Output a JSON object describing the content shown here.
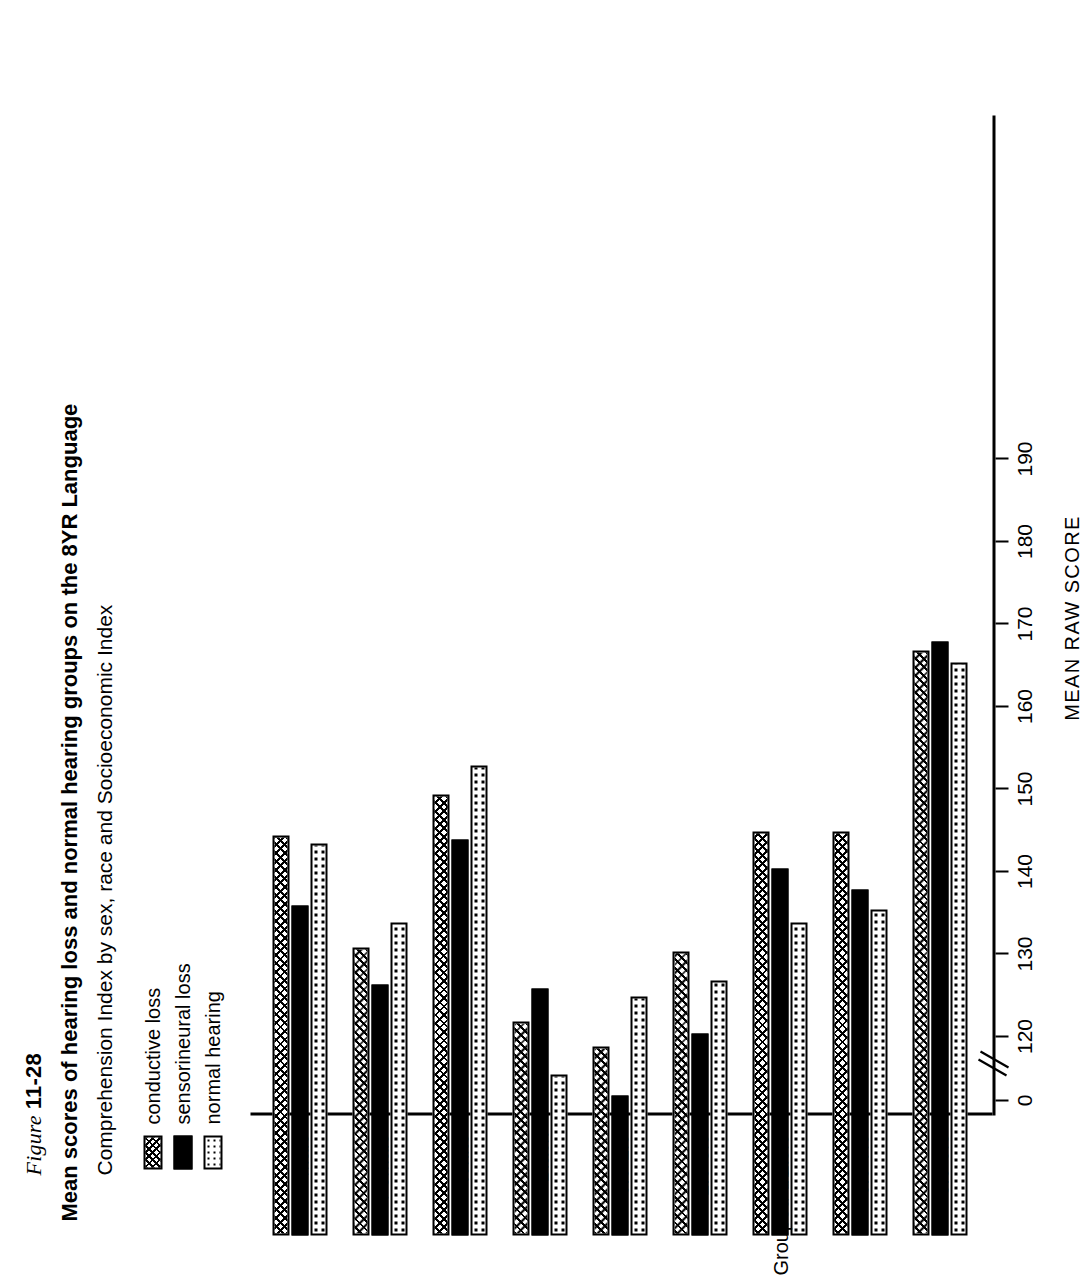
{
  "figure": {
    "label_prefix": "Figure",
    "label_number": "11-28",
    "title_line1": "Mean scores of hearing loss and normal hearing groups on the 8YR Language",
    "title_line2": "Comprehension Index by sex, race and Socioeconomic Index"
  },
  "legend": {
    "items": [
      {
        "key": "conductive",
        "label": "conductive loss",
        "pattern": "crosshatch"
      },
      {
        "key": "sensorineural",
        "label": "sensorineural loss",
        "pattern": "solid-black"
      },
      {
        "key": "normal",
        "label": "normal hearing",
        "pattern": "dotted"
      }
    ]
  },
  "axes": {
    "value_axis_title": "MEAN RAW SCORE",
    "value_ticks": [
      "0",
      "120",
      "130",
      "140",
      "150",
      "160",
      "170",
      "180",
      "190"
    ],
    "value_min": 120,
    "value_max": 190,
    "has_axis_break": true,
    "zero_tick_label": "0",
    "category_axis_title": "Grouped SEI"
  },
  "chart_data": {
    "type": "bar",
    "orientation": "horizontal",
    "title": "Mean scores of hearing loss and normal hearing groups on the 8YR Language Comprehension Index by sex, race and Socioeconomic Index",
    "xlabel": "MEAN RAW SCORE",
    "ylabel": "Grouped SEI",
    "xlim": [
      120,
      190
    ],
    "grid": false,
    "legend_position": "top-left",
    "axis_break": "between 0 and 120",
    "categories": [
      "Male",
      "Female",
      "White",
      "Black",
      "0.0-1.9",
      "2.0-3.9",
      "4.0-5.9",
      "6.0-7.9",
      "8.0-9.5"
    ],
    "series": [
      {
        "name": "conductive loss",
        "pattern": "crosshatch",
        "values": [
          159.0,
          145.5,
          164.0,
          136.5,
          133.5,
          145.0,
          159.5,
          159.5,
          181.5
        ]
      },
      {
        "name": "sensorineural loss",
        "pattern": "solid-black",
        "values": [
          150.5,
          141.0,
          158.5,
          140.5,
          127.5,
          135.0,
          155.0,
          152.5,
          182.5
        ]
      },
      {
        "name": "normal hearing",
        "pattern": "dotted",
        "values": [
          158.0,
          148.5,
          167.5,
          130.0,
          139.5,
          141.5,
          148.5,
          150.0,
          180.0
        ]
      }
    ]
  }
}
